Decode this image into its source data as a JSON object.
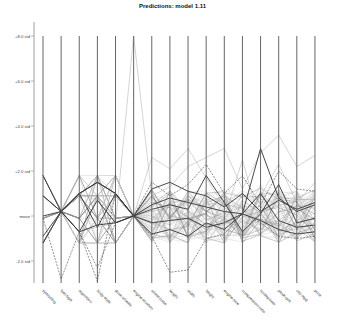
{
  "chart_data": {
    "type": "parallel-coordinates",
    "title": "Predictions: model 1.11",
    "xlabel": "",
    "ylabel": "",
    "y_ticks": [
      {
        "label": "+8.0 std",
        "value": 8
      },
      {
        "label": "+6.0 std",
        "value": 6
      },
      {
        "label": "+4.0 std",
        "value": 4
      },
      {
        "label": "+2.0 std",
        "value": 2
      },
      {
        "label": "mean",
        "value": 0
      },
      {
        "label": "-2.0 std",
        "value": -2
      }
    ],
    "ylim": [
      -2.9,
      8.6
    ],
    "grid": false,
    "legend": null,
    "axes": [
      "symboling",
      "fuel-type",
      "aspiration",
      "body-style",
      "drive-wheels",
      "engine-location",
      "wheel-base",
      "length",
      "width",
      "height",
      "engine-size",
      "compression-ratio",
      "horsepower",
      "peak-rpm",
      "city-mpg",
      "price"
    ],
    "series_note": "Many overlaid lines (solid dark, dashed dark, and light grey) showing standardized values per record; values estimated from pixel positions.",
    "series": [
      {
        "name": "line-a",
        "style": "solid",
        "values": [
          1.8,
          0.2,
          1.0,
          1.5,
          1.0,
          0,
          0.5,
          0.8,
          0.6,
          0.4,
          0.2,
          0.1,
          3.0,
          0.8,
          0.2,
          0.5
        ]
      },
      {
        "name": "line-b",
        "style": "solid",
        "values": [
          -1.2,
          0.2,
          1.0,
          -0.5,
          1.0,
          0,
          -0.3,
          -0.2,
          -0.1,
          -0.5,
          -0.3,
          0.1,
          1.0,
          -0.2,
          -0.5,
          -0.4
        ]
      },
      {
        "name": "line-c",
        "style": "solid",
        "values": [
          0.9,
          0.2,
          -0.7,
          -0.4,
          -0.3,
          0,
          1.2,
          1.5,
          1.1,
          0.9,
          0.4,
          1.0,
          0.2,
          0.7,
          0.3,
          0.6
        ]
      },
      {
        "name": "line-d",
        "style": "solid",
        "values": [
          0.0,
          0.2,
          1.0,
          1.5,
          1.0,
          0,
          -0.8,
          -0.6,
          -0.9,
          -0.3,
          -0.6,
          0.1,
          -0.2,
          -0.6,
          -0.8,
          -0.7
        ]
      },
      {
        "name": "line-e",
        "style": "solid",
        "values": [
          -0.9,
          0.2,
          -0.7,
          0.7,
          -0.3,
          0,
          0.3,
          0.5,
          0.3,
          1.8,
          0.6,
          -0.7,
          0.1,
          1.4,
          -0.3,
          -0.1
        ]
      },
      {
        "name": "line-f",
        "style": "dashed",
        "values": [
          -0.1,
          -2.8,
          -0.7,
          -2.3,
          -0.3,
          0,
          -0.9,
          -2.5,
          -2.4,
          -1.0,
          -0.8,
          0.1,
          -0.3,
          -0.9,
          -1.0,
          -0.9
        ]
      },
      {
        "name": "line-g",
        "style": "dashed",
        "values": [
          0.9,
          0.2,
          -0.7,
          -2.9,
          1.0,
          0,
          1.5,
          0.9,
          1.4,
          2.3,
          1.0,
          1.8,
          0.5,
          2.0,
          1.2,
          1.1
        ]
      },
      {
        "name": "line-h",
        "style": "light",
        "values": [
          -0.1,
          0.2,
          1.0,
          0.7,
          -0.3,
          8.0,
          0.9,
          1.3,
          2.2,
          2.6,
          3.0,
          1.2,
          2.8,
          3.6,
          2.2,
          2.7
        ]
      },
      {
        "name": "line-i",
        "style": "light",
        "values": [
          0.9,
          0.2,
          -0.7,
          -0.5,
          -0.3,
          0,
          2.6,
          2.1,
          3.0,
          1.7,
          0.4,
          -0.8,
          0.9,
          2.3,
          0.6,
          1.5
        ]
      },
      {
        "name": "line-j",
        "style": "light",
        "values": [
          -1.2,
          0.2,
          1.0,
          1.5,
          1.0,
          0,
          0.0,
          -0.4,
          0.2,
          -1.2,
          -0.1,
          2.5,
          -0.4,
          -0.2,
          -1.1,
          -0.8
        ]
      }
    ]
  }
}
